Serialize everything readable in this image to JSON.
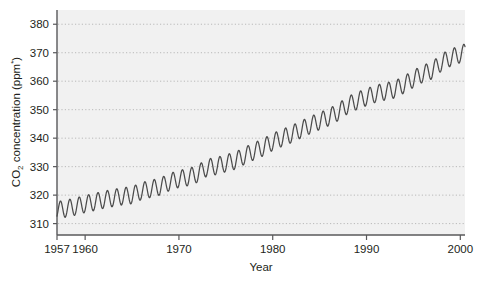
{
  "figure": {
    "background_color": "#ffffff",
    "plot_background_color": "#f1f1f1",
    "line_color": "#4b4b4b",
    "grid_color": "#b9b9b9",
    "axis_color": "#58585a",
    "text_color": "#231f20"
  },
  "axes": {
    "x_title": "Year",
    "y_title_main": "CO",
    "y_title_sub": "2",
    "y_title_rest": " concentration (ppm",
    "y_title_star": "*",
    "y_title_close": ")",
    "y_title_full": "CO2 concentration (ppm*)"
  },
  "chart_data": {
    "type": "line",
    "title": "",
    "subtitle": "",
    "xlabel": "Year",
    "ylabel": "CO2 concentration (ppm*)",
    "xlim": [
      1957,
      2000.5
    ],
    "ylim": [
      306,
      385
    ],
    "xticks": [
      1957,
      1960,
      1970,
      1980,
      1990,
      2000
    ],
    "xtick_labels": [
      "1957",
      "1960",
      "1970",
      "1980",
      "1990",
      "2000"
    ],
    "yticks": [
      310,
      320,
      330,
      340,
      350,
      360,
      370,
      380
    ],
    "ytick_labels": [
      "310",
      "320",
      "330",
      "340",
      "350",
      "360",
      "370",
      "380"
    ],
    "grid": "horizontal-dotted",
    "legend": "none",
    "series": [
      {
        "name": "Mauna Loa atmospheric CO2 (monthly mean)",
        "description": "Keeling curve: rising annual-mean CO2 with an annual sawtooth oscillation of roughly 6 ppm peak-to-trough; seasonal maximum in May, minimum in late September.",
        "annual_mean": {
          "x": [
            1957,
            1958,
            1959,
            1960,
            1961,
            1962,
            1963,
            1964,
            1965,
            1966,
            1967,
            1968,
            1969,
            1970,
            1971,
            1972,
            1973,
            1974,
            1975,
            1976,
            1977,
            1978,
            1979,
            1980,
            1981,
            1982,
            1983,
            1984,
            1985,
            1986,
            1987,
            1988,
            1989,
            1990,
            1991,
            1992,
            1993,
            1994,
            1995,
            1996,
            1997,
            1998,
            1999,
            2000
          ],
          "y": [
            314.7,
            315.3,
            316.0,
            316.9,
            317.6,
            318.4,
            319.0,
            319.6,
            320.0,
            321.4,
            322.2,
            323.0,
            324.6,
            325.7,
            326.3,
            327.5,
            329.7,
            330.2,
            331.2,
            332.1,
            333.8,
            335.4,
            336.8,
            338.7,
            340.1,
            341.4,
            343.0,
            344.6,
            346.0,
            347.4,
            349.2,
            351.6,
            353.1,
            354.4,
            355.6,
            356.4,
            357.1,
            358.8,
            360.8,
            362.6,
            363.8,
            366.6,
            368.3,
            369.5
          ]
        },
        "seasonal_amplitude_ppm": 6.0,
        "seasonal_peak_month": "May",
        "seasonal_trough_month": "September",
        "start_value": 314.7,
        "end_value": 372.5,
        "units": "ppm"
      }
    ]
  }
}
